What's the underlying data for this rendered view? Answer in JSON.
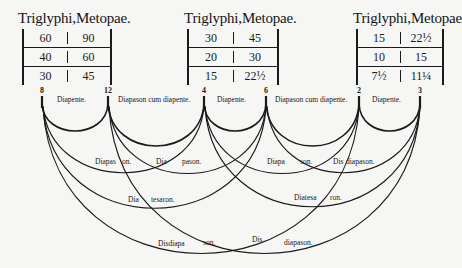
{
  "tables": [
    {
      "title": "Triglyphi,Metopae.",
      "rows": [
        [
          "60",
          "90"
        ],
        [
          "40",
          "60"
        ],
        [
          "30",
          "45"
        ]
      ]
    },
    {
      "title": "Triglyphi,Metopae.",
      "rows": [
        [
          "30",
          "45"
        ],
        [
          "20",
          "30"
        ],
        [
          "15",
          "22½"
        ]
      ]
    },
    {
      "title": "Triglyphi,Metopae",
      "rows": [
        [
          "15",
          "22½"
        ],
        [
          "10",
          "15"
        ],
        [
          "7½",
          "11¼"
        ]
      ]
    }
  ],
  "nodes": [
    "8",
    "12",
    "4",
    "6",
    "2",
    "3"
  ],
  "arc_labels": {
    "a8_12": "Diapente.",
    "a12_4": "Diapason cum diapente.",
    "a4_6": "Diapente.",
    "a6_2": "Diapason cum diapente.",
    "a2_3": "Diapente.",
    "a8_4_1": "Diapas",
    "a8_4_2": "on.",
    "a12_6_1": "Dia",
    "a12_6_2": "pason.",
    "a4_2_1": "Diapa",
    "a4_2_2": "son.",
    "a6_3_1": "Dis",
    "a6_3_2": "diapason.",
    "a8_6_1": "Dia",
    "a8_6_2": "tesaron.",
    "a4_3_1": "Diatesa",
    "a4_3_2": "ron.",
    "a8_2_1": "Disdiapa",
    "a8_2_2": "son.",
    "a12_3_1": "Dis",
    "a12_3_2": "diapason."
  }
}
